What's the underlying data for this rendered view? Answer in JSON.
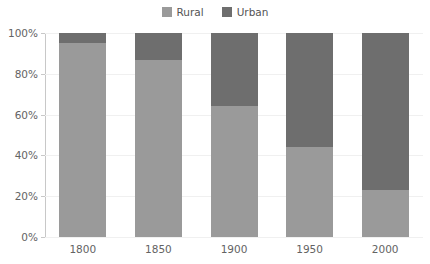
{
  "legend": {
    "position": "top-center",
    "entries": [
      {
        "label": "Rural",
        "color": "#9a9a9a",
        "swatch_name": "legend-swatch-rural"
      },
      {
        "label": "Urban",
        "color": "#6e6e6e",
        "swatch_name": "legend-swatch-urban"
      }
    ]
  },
  "axes": {
    "y_ticks": [
      "0%",
      "20%",
      "40%",
      "60%",
      "80%",
      "100%"
    ],
    "y_tick_values": [
      0,
      20,
      40,
      60,
      80,
      100
    ],
    "x_ticks": [
      "1800",
      "1850",
      "1900",
      "1950",
      "2000"
    ]
  },
  "chart_data": {
    "type": "bar",
    "stacked": true,
    "stack_mode": "percent",
    "title": "",
    "subtitle": "",
    "xlabel": "",
    "ylabel": "",
    "ylim": [
      0,
      100
    ],
    "grid": true,
    "legend_position": "top-center",
    "categories": [
      "1800",
      "1850",
      "1900",
      "1950",
      "2000"
    ],
    "series": [
      {
        "name": "Rural",
        "color": "#9a9a9a",
        "values": [
          95,
          87,
          64,
          44,
          23
        ]
      },
      {
        "name": "Urban",
        "color": "#6e6e6e",
        "values": [
          5,
          13,
          36,
          56,
          77
        ]
      }
    ]
  },
  "colors": {
    "rural": "#9a9a9a",
    "urban": "#6e6e6e",
    "axis": "#c8c8c8",
    "grid": "#f0f0f0",
    "tick_text": "#636363",
    "legend_text": "#555555",
    "background": "#ffffff"
  }
}
